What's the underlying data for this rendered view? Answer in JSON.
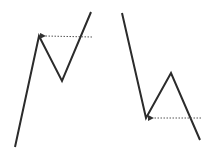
{
  "diagram": {
    "type": "price-pattern-sketch",
    "colors": {
      "background": "#ffffff",
      "line": "#2b2b2b",
      "arrow": "#555555"
    },
    "figures": [
      {
        "name": "double-bottom-breakout-up",
        "polyline": [
          [
            15,
            147
          ],
          [
            39,
            36
          ],
          [
            62,
            81
          ],
          [
            91,
            12
          ]
        ],
        "arrow": {
          "from": [
            92,
            37
          ],
          "to": [
            40,
            36
          ],
          "style": "dotted"
        }
      },
      {
        "name": "double-top-breakout-down",
        "polyline": [
          [
            122,
            13
          ],
          [
            146,
            118
          ],
          [
            171,
            73
          ],
          [
            200,
            140
          ]
        ],
        "arrow": {
          "from": [
            201,
            118
          ],
          "to": [
            148,
            118
          ],
          "style": "dotted"
        }
      }
    ]
  }
}
